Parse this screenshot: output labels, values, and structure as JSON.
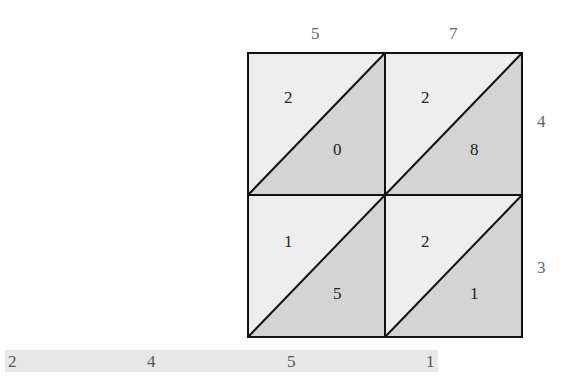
{
  "diagram": {
    "type": "lattice-multiplication",
    "top_digits": [
      "5",
      "7"
    ],
    "right_digits": [
      "4",
      "3"
    ],
    "cells": [
      {
        "row": 0,
        "col": 0,
        "tens": "2",
        "ones": "0"
      },
      {
        "row": 0,
        "col": 1,
        "tens": "2",
        "ones": "8"
      },
      {
        "row": 1,
        "col": 0,
        "tens": "1",
        "ones": "5"
      },
      {
        "row": 1,
        "col": 1,
        "tens": "2",
        "ones": "1"
      }
    ],
    "result_digits": [
      "2",
      "4",
      "5",
      "1"
    ],
    "colors": {
      "upper_triangle": "#eeeeee",
      "lower_triangle": "#d4d4d4",
      "grid_line": "#111111",
      "label": "#666666",
      "result_strip": "#e8e8e8"
    }
  }
}
